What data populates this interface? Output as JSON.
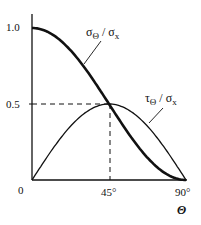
{
  "chart_data": {
    "type": "line",
    "title": "",
    "xlabel": "Θ",
    "ylabel": "",
    "x_ticks": [
      "0",
      "45°",
      "90°"
    ],
    "y_ticks": [
      "0",
      "0.5",
      "1.0"
    ],
    "xlim": [
      0,
      90
    ],
    "ylim": [
      0,
      1.0
    ],
    "grid": false,
    "legend": "inline curve labels",
    "x": [
      0,
      15,
      30,
      45,
      60,
      75,
      90
    ],
    "series": [
      {
        "name": "σΘ / σx",
        "style": "thick solid",
        "values": [
          1.0,
          0.933,
          0.75,
          0.5,
          0.25,
          0.067,
          0.0
        ]
      },
      {
        "name": "τΘ / σx",
        "style": "thin solid",
        "values": [
          0.0,
          0.25,
          0.433,
          0.5,
          0.433,
          0.25,
          0.0
        ]
      }
    ],
    "annotations": [
      {
        "type": "dashed-line",
        "from": [
          0,
          0.5
        ],
        "to": [
          45,
          0.5
        ]
      },
      {
        "type": "dashed-line",
        "from": [
          45,
          0
        ],
        "to": [
          45,
          0.5
        ]
      },
      {
        "type": "curve-label",
        "text": "σΘ / σx",
        "target": "σΘ / σx"
      },
      {
        "type": "curve-label",
        "text": "τΘ / σx",
        "target": "τΘ / σx"
      }
    ]
  },
  "labels": {
    "y_1": "1.0",
    "y_05": "0.5",
    "origin": "0",
    "x_45": "45°",
    "x_90": "90°",
    "x_axis": "Θ",
    "sigma_main": "σ",
    "sigma_sub": "Θ",
    "sigma_div": " / σ",
    "sigma_sub2": "x",
    "tau_main": "τ",
    "tau_sub": "Θ",
    "tau_div": " / σ",
    "tau_sub2": "x"
  }
}
